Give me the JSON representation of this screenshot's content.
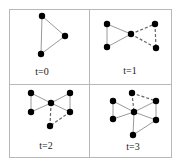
{
  "figure": {
    "grid": {
      "left": 9,
      "top": 9,
      "right": 171,
      "bottom": 157,
      "midx": 89,
      "midy": 84,
      "border_color": "#b8b8b8"
    },
    "panels": [
      {
        "label": "t=0",
        "label_pos": [
          42,
          75
        ],
        "nodes": [
          [
            42,
            16
          ],
          [
            65,
            36
          ],
          [
            41,
            54
          ]
        ],
        "solid_edges": [
          [
            0,
            2
          ],
          [
            0,
            1
          ],
          [
            1,
            2
          ]
        ],
        "dashed_edges": []
      },
      {
        "label": "t=1",
        "label_pos": [
          130,
          74
        ],
        "nodes": [
          [
            107,
            24
          ],
          [
            107,
            47
          ],
          [
            131,
            34
          ],
          [
            155,
            24
          ],
          [
            156,
            48
          ]
        ],
        "solid_edges": [
          [
            0,
            1
          ],
          [
            0,
            2
          ],
          [
            1,
            2
          ]
        ],
        "dashed_edges": [
          [
            2,
            3
          ],
          [
            2,
            4
          ],
          [
            3,
            4
          ]
        ]
      },
      {
        "label": "t=2",
        "label_pos": [
          46,
          149
        ],
        "nodes": [
          [
            31,
            93
          ],
          [
            31,
            112
          ],
          [
            51,
            103
          ],
          [
            70,
            93
          ],
          [
            70,
            112
          ],
          [
            50,
            126
          ]
        ],
        "solid_edges": [
          [
            0,
            1
          ],
          [
            0,
            2
          ],
          [
            1,
            2
          ],
          [
            2,
            3
          ],
          [
            2,
            4
          ],
          [
            3,
            4
          ]
        ],
        "dashed_edges": [
          [
            2,
            5
          ],
          [
            4,
            5
          ]
        ]
      },
      {
        "label": "t=3",
        "label_pos": [
          133,
          150
        ],
        "nodes": [
          [
            113,
            101
          ],
          [
            113,
            119
          ],
          [
            132,
            93
          ],
          [
            134,
            112
          ],
          [
            156,
            101
          ],
          [
            156,
            120
          ],
          [
            133,
            135
          ]
        ],
        "solid_edges": [
          [
            0,
            1
          ],
          [
            0,
            3
          ],
          [
            1,
            3
          ],
          [
            3,
            4
          ],
          [
            3,
            5
          ],
          [
            4,
            5
          ],
          [
            3,
            6
          ],
          [
            5,
            6
          ]
        ],
        "dashed_edges": [
          [
            2,
            3
          ],
          [
            2,
            4
          ]
        ]
      }
    ],
    "colors": {
      "node": "#000000",
      "edge": "#9a9a9a",
      "dashed_edge": "#666666"
    }
  }
}
